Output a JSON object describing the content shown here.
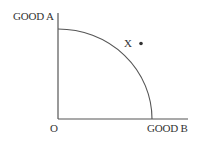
{
  "diagram": {
    "y_axis_label": "GOOD A",
    "x_axis_label": "GOOD B",
    "origin_label": "O",
    "point_label": "X",
    "colors": {
      "axis": "#555555",
      "curve": "#555555",
      "text": "#333333",
      "point": "#333333"
    }
  }
}
